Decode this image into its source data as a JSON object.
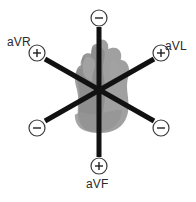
{
  "diagram": {
    "background_color": "#ffffff",
    "axis_color": "#111111",
    "heart_color": "#9a9a9a",
    "text_color": "#2a2a2a",
    "center": {
      "x": 99,
      "y": 89
    },
    "labels": {
      "avr": "aVR",
      "avl": "aVL",
      "avf": "aVF"
    },
    "markers": [
      {
        "id": "top",
        "polarity": "−",
        "lead": "aVF",
        "end": "negative",
        "x": 99,
        "y": 18,
        "r": 8,
        "angle_deg": 270
      },
      {
        "id": "upper-left",
        "polarity": "+",
        "lead": "aVR",
        "end": "positive",
        "x": 37,
        "y": 53,
        "r": 8,
        "angle_deg": 210
      },
      {
        "id": "upper-right",
        "polarity": "+",
        "lead": "aVL",
        "end": "positive",
        "x": 161,
        "y": 53,
        "r": 8,
        "angle_deg": 330
      },
      {
        "id": "lower-left",
        "polarity": "−",
        "lead": "aVL",
        "end": "negative",
        "x": 37,
        "y": 128,
        "r": 8,
        "angle_deg": 150
      },
      {
        "id": "lower-right",
        "polarity": "−",
        "lead": "aVR",
        "end": "negative",
        "x": 161,
        "y": 128,
        "r": 8,
        "angle_deg": 30
      },
      {
        "id": "bottom",
        "polarity": "+",
        "lead": "aVF",
        "end": "positive",
        "x": 99,
        "y": 166,
        "r": 8,
        "angle_deg": 90
      }
    ],
    "axes": [
      {
        "id": "avf-axis",
        "name": "vertical-axis",
        "x1": 99,
        "y1": 27,
        "x2": 99,
        "y2": 157,
        "width": 5
      },
      {
        "id": "avr-axis",
        "name": "avr-oblique-axis",
        "x1": 45,
        "y1": 59,
        "x2": 154,
        "y2": 121,
        "width": 5
      },
      {
        "id": "avl-axis",
        "name": "avl-oblique-axis",
        "x1": 154,
        "y1": 59,
        "x2": 45,
        "y2": 121,
        "width": 5
      }
    ]
  }
}
